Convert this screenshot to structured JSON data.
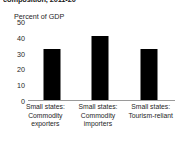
{
  "chart_data": {
    "type": "bar",
    "title": "composition, 2011-20",
    "subtitle": "",
    "ylabel": "Percent of GDP",
    "xlabel": "",
    "ylim": [
      0,
      50
    ],
    "yticks": [
      50,
      40,
      30,
      20,
      10,
      0
    ],
    "grid": false,
    "legend": null,
    "bar_color": "#000000",
    "axis_color": "#9a9a9a",
    "categories": [
      "Small states: Commodity exporters",
      "Small states: Commodity importers",
      "Small states: Tourism-reliant"
    ],
    "category_lines": [
      [
        "Small states:",
        "Commodity",
        "exporters"
      ],
      [
        "Small states:",
        "Commodity",
        "importers"
      ],
      [
        "Small states:",
        "Tourism-reliant"
      ]
    ],
    "values": [
      33,
      41,
      33
    ]
  }
}
